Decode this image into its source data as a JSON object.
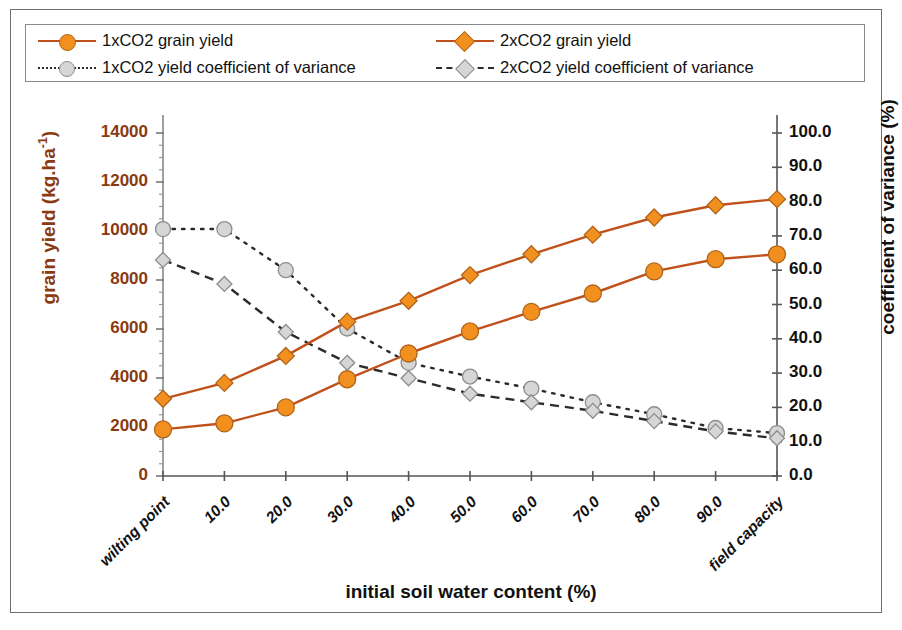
{
  "legend": {
    "items": [
      {
        "label": "1xCO2 grain yield",
        "marker": "circle-orange",
        "line": "solid-orange"
      },
      {
        "label": "2xCO2 grain yield",
        "marker": "diamond-orange",
        "line": "solid-orange"
      },
      {
        "label": "1xCO2 yield coefficient of variance",
        "marker": "circle-grey",
        "line": "dotted-black"
      },
      {
        "label": "2xCO2 yield coefficient of variance",
        "marker": "diamond-grey",
        "line": "dashed-black"
      }
    ]
  },
  "colors": {
    "orange_marker": "#f2901f",
    "orange_line": "#c0511a",
    "left_axis_text": "#8a3a10",
    "grey_marker": "#d6d6d6",
    "dark_line": "#2b2b2b",
    "frame": "#6f6f6f"
  },
  "chart_data": {
    "type": "line",
    "title": "",
    "xlabel": "initial soil water content  (%)",
    "ylabel": "grain yield (kg.ha-1)",
    "ylabel_secondary": "coefficient of variance (%)",
    "categories": [
      "wilting point",
      "10.0",
      "20.0",
      "30.0",
      "40.0",
      "50.0",
      "60.0",
      "70.0",
      "80.0",
      "90.0",
      "field capacity"
    ],
    "ylim": [
      0,
      14000
    ],
    "yticks": [
      "0",
      "2000",
      "4000",
      "6000",
      "8000",
      "10000",
      "12000",
      "14000"
    ],
    "ylim_secondary": [
      0,
      100
    ],
    "yticks_secondary": [
      "0.0",
      "10.0",
      "20.0",
      "30.0",
      "40.0",
      "50.0",
      "60.0",
      "70.0",
      "80.0",
      "90.0",
      "100.0"
    ],
    "grid": false,
    "legend_position": "top",
    "series": [
      {
        "name": "1xCO2 grain yield",
        "axis": "left",
        "style": "solid",
        "marker": "circle",
        "color": "#f2901f",
        "values": [
          1900,
          2150,
          2800,
          3950,
          5000,
          5900,
          6700,
          7450,
          8350,
          8850,
          9050
        ]
      },
      {
        "name": "2xCO2 grain yield",
        "axis": "left",
        "style": "solid",
        "marker": "diamond",
        "color": "#f2901f",
        "values": [
          3150,
          3800,
          4900,
          6300,
          7150,
          8200,
          9050,
          9850,
          10550,
          11050,
          11300
        ]
      },
      {
        "name": "1xCO2 yield coefficient of variance",
        "axis": "right",
        "style": "dotted",
        "marker": "circle",
        "color": "#d6d6d6",
        "values": [
          72.0,
          72.0,
          60.0,
          43.0,
          33.0,
          29.0,
          25.5,
          21.5,
          18.0,
          14.0,
          12.5
        ]
      },
      {
        "name": "2xCO2 yield coefficient of variance",
        "axis": "right",
        "style": "dashed",
        "marker": "diamond",
        "color": "#d6d6d6",
        "values": [
          63.0,
          56.0,
          42.0,
          33.0,
          28.5,
          24.0,
          21.5,
          19.0,
          16.0,
          13.0,
          11.0
        ]
      }
    ]
  }
}
